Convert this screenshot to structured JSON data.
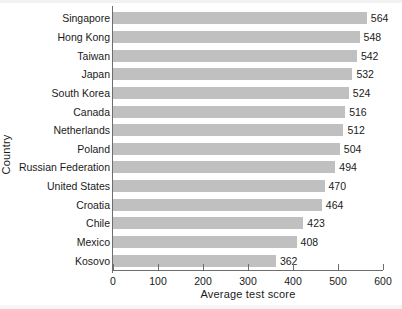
{
  "chart_data": {
    "type": "bar",
    "orientation": "horizontal",
    "title": "",
    "xlabel": "Average test score",
    "ylabel": "Country",
    "categories": [
      "Singapore",
      "Hong Kong",
      "Taiwan",
      "Japan",
      "South Korea",
      "Canada",
      "Netherlands",
      "Poland",
      "Russian Federation",
      "United States",
      "Croatia",
      "Chile",
      "Mexico",
      "Kosovo"
    ],
    "values": [
      564,
      548,
      542,
      532,
      524,
      516,
      512,
      504,
      494,
      470,
      464,
      423,
      408,
      362
    ],
    "value_labels": [
      "564",
      "548",
      "542",
      "532",
      "524",
      "516",
      "512",
      "504",
      "494",
      "470",
      "464",
      "423",
      "408",
      "362"
    ],
    "xlim": [
      0,
      600
    ],
    "xticks": [
      0,
      100,
      200,
      300,
      400,
      500,
      600
    ],
    "xtick_labels": [
      "0",
      "100",
      "200",
      "300",
      "400",
      "500",
      "600"
    ],
    "grid": false,
    "legend": null,
    "bar_color": "#c0c0c0",
    "axis_color": "#6e6e6e",
    "text_color": "#1a1a1a"
  }
}
